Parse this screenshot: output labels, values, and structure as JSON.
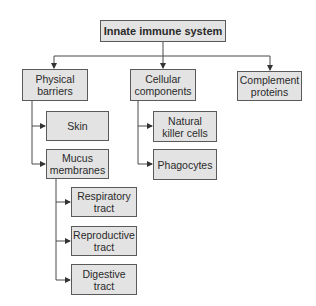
{
  "diagram": {
    "title": "Innate immune system",
    "colors": {
      "box_fill": "#e3e3e3",
      "box_border": "#5a5a5a",
      "line": "#4a4a4a",
      "text": "#2a2a2a"
    },
    "nodes": {
      "root": {
        "label": "Innate immune system"
      },
      "physical_barriers": {
        "label": "Physical\nbarriers"
      },
      "cellular_components": {
        "label": "Cellular\ncomponents"
      },
      "complement_proteins": {
        "label": "Complement\nproteins"
      },
      "skin": {
        "label": "Skin"
      },
      "mucus_membranes": {
        "label": "Mucus\nmembranes"
      },
      "natural_killer_cells": {
        "label": "Natural\nkiller cells"
      },
      "phagocytes": {
        "label": "Phagocytes"
      },
      "respiratory_tract": {
        "label": "Respiratory\ntract"
      },
      "reproductive_tract": {
        "label": "Reproductive\ntract"
      },
      "digestive_tract": {
        "label": "Digestive\ntract"
      }
    },
    "edges": [
      [
        "Innate immune system",
        "Physical barriers"
      ],
      [
        "Innate immune system",
        "Cellular components"
      ],
      [
        "Innate immune system",
        "Complement proteins"
      ],
      [
        "Physical barriers",
        "Skin"
      ],
      [
        "Physical barriers",
        "Mucus membranes"
      ],
      [
        "Cellular components",
        "Natural killer cells"
      ],
      [
        "Cellular components",
        "Phagocytes"
      ],
      [
        "Mucus membranes",
        "Respiratory tract"
      ],
      [
        "Mucus membranes",
        "Reproductive tract"
      ],
      [
        "Mucus membranes",
        "Digestive tract"
      ]
    ]
  }
}
